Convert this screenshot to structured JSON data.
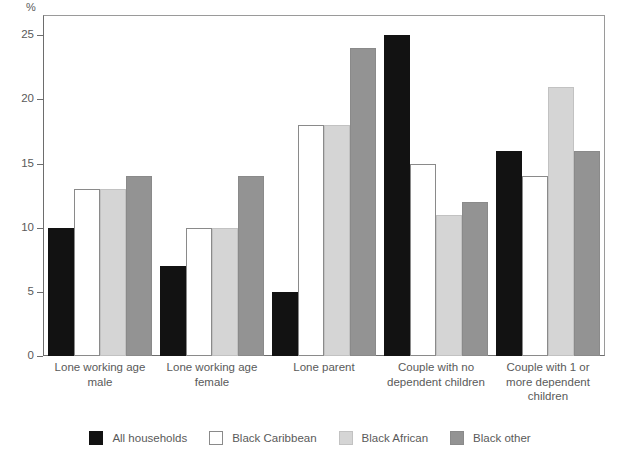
{
  "chart_data": {
    "type": "bar",
    "title": "",
    "subtitle": "",
    "xlabel": "",
    "ylabel": "%",
    "ylim": [
      0,
      26.5
    ],
    "yticks": [
      0,
      5,
      10,
      15,
      20,
      25
    ],
    "ytick_labels": [
      "0",
      "5",
      "10",
      "15",
      "20",
      "25"
    ],
    "grid": false,
    "legend_position": "bottom",
    "categories": [
      "Lone working age male",
      "Lone working age female",
      "Lone parent",
      "Couple with no dependent children",
      "Couple with 1 or more dependent children"
    ],
    "category_lines": [
      [
        "Lone working age",
        "male"
      ],
      [
        "Lone working age",
        "female"
      ],
      [
        "Lone parent"
      ],
      [
        "Couple with no",
        "dependent children"
      ],
      [
        "Couple with 1 or",
        "more dependent",
        "children"
      ]
    ],
    "series": [
      {
        "name": "All households",
        "color": "#121212",
        "values": [
          10,
          7,
          5,
          25,
          16
        ]
      },
      {
        "name": "Black Caribbean",
        "color": "#ffffff",
        "values": [
          13,
          10,
          18,
          15,
          14
        ]
      },
      {
        "name": "Black African",
        "color": "#d5d5d5",
        "values": [
          13,
          10,
          18,
          11,
          21
        ]
      },
      {
        "name": "Black other",
        "color": "#939393",
        "values": [
          14,
          14,
          24,
          12,
          16
        ]
      }
    ]
  },
  "axis": {
    "unit_label": "%"
  },
  "colors": {
    "axis": "#6d6d6d",
    "frame": "#9a9a9a",
    "text": "#5a5a5a",
    "background": "#ffffff"
  }
}
